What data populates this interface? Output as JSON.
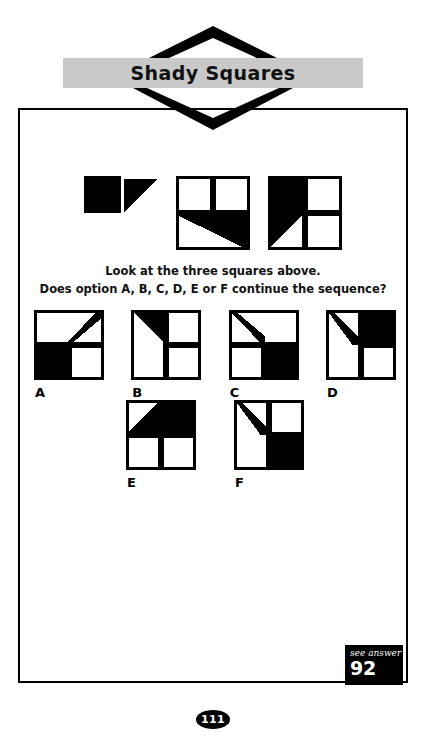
{
  "header": {
    "title": "Shady Squares",
    "banner_color": "#c9c9c9",
    "chevron_up_icon": "chevron-up-icon",
    "chevron_down_icon": "chevron-down-icon"
  },
  "prompt": {
    "line1": "Look at the three squares above.",
    "line2": "Does option A, B, C, D, E or F continue the sequence?"
  },
  "puzzle": {
    "ink_color": "#000000",
    "paper_color": "#ffffff",
    "sequence": [
      {
        "name": "sequence-square-1",
        "shapes": [
          {
            "type": "rect",
            "x": 0,
            "y": 0,
            "w": 50,
            "h": 50,
            "fill": "#000000"
          },
          {
            "type": "rect",
            "x": 4,
            "y": 54,
            "w": 46,
            "h": 46,
            "fill": "#ffffff"
          },
          {
            "type": "poly",
            "points": "54,4 100,4 100,96 54,96 54,50",
            "fill": "#ffffff"
          },
          {
            "type": "poly",
            "points": "54,4 100,4 54,50",
            "fill": "#000000"
          }
        ]
      },
      {
        "name": "sequence-square-2",
        "shapes": [
          {
            "type": "rect",
            "x": 0,
            "y": 0,
            "w": 100,
            "h": 100,
            "fill": "#000000"
          },
          {
            "type": "rect",
            "x": 4,
            "y": 4,
            "w": 42,
            "h": 42,
            "fill": "#ffffff"
          },
          {
            "type": "rect",
            "x": 54,
            "y": 4,
            "w": 42,
            "h": 42,
            "fill": "#ffffff"
          },
          {
            "type": "poly",
            "points": "4,54 96,54 96,96 4,96",
            "fill": "#000000"
          },
          {
            "type": "poly",
            "points": "4,54 4,96 90,96",
            "fill": "#ffffff"
          }
        ]
      },
      {
        "name": "sequence-square-3",
        "shapes": [
          {
            "type": "rect",
            "x": 0,
            "y": 0,
            "w": 100,
            "h": 100,
            "fill": "#000000"
          },
          {
            "type": "poly",
            "points": "4,4 46,4 46,96 4,96",
            "fill": "#000000"
          },
          {
            "type": "poly",
            "points": "4,96 46,54 46,96",
            "fill": "#ffffff"
          },
          {
            "type": "rect",
            "x": 54,
            "y": 4,
            "w": 42,
            "h": 42,
            "fill": "#ffffff"
          },
          {
            "type": "rect",
            "x": 54,
            "y": 54,
            "w": 42,
            "h": 42,
            "fill": "#ffffff"
          }
        ]
      }
    ],
    "options": [
      {
        "label": "A",
        "name": "option-a",
        "shapes": [
          {
            "type": "rect",
            "x": 0,
            "y": 0,
            "w": 100,
            "h": 100,
            "fill": "#000000"
          },
          {
            "type": "rect",
            "x": 4,
            "y": 4,
            "w": 92,
            "h": 42,
            "fill": "#ffffff"
          },
          {
            "type": "poly",
            "points": "88,4 96,4 96,12 56,46 48,46",
            "fill": "#000000"
          },
          {
            "type": "rect",
            "x": 4,
            "y": 54,
            "w": 42,
            "h": 42,
            "fill": "#000000"
          },
          {
            "type": "rect",
            "x": 54,
            "y": 54,
            "w": 42,
            "h": 42,
            "fill": "#ffffff"
          }
        ]
      },
      {
        "label": "B",
        "name": "option-b",
        "shapes": [
          {
            "type": "rect",
            "x": 0,
            "y": 0,
            "w": 100,
            "h": 100,
            "fill": "#000000"
          },
          {
            "type": "rect",
            "x": 4,
            "y": 4,
            "w": 42,
            "h": 92,
            "fill": "#ffffff"
          },
          {
            "type": "poly",
            "points": "4,4 46,4 46,46",
            "fill": "#000000"
          },
          {
            "type": "rect",
            "x": 54,
            "y": 4,
            "w": 42,
            "h": 42,
            "fill": "#ffffff"
          },
          {
            "type": "rect",
            "x": 54,
            "y": 54,
            "w": 42,
            "h": 42,
            "fill": "#ffffff"
          }
        ]
      },
      {
        "label": "C",
        "name": "option-c",
        "shapes": [
          {
            "type": "rect",
            "x": 0,
            "y": 0,
            "w": 100,
            "h": 100,
            "fill": "#000000"
          },
          {
            "type": "rect",
            "x": 4,
            "y": 4,
            "w": 92,
            "h": 42,
            "fill": "#ffffff"
          },
          {
            "type": "poly",
            "points": "4,4 12,4 52,38 52,46 44,46",
            "fill": "#000000"
          },
          {
            "type": "rect",
            "x": 4,
            "y": 54,
            "w": 42,
            "h": 42,
            "fill": "#ffffff"
          },
          {
            "type": "rect",
            "x": 54,
            "y": 54,
            "w": 42,
            "h": 42,
            "fill": "#000000"
          }
        ]
      },
      {
        "label": "D",
        "name": "option-d",
        "shapes": [
          {
            "type": "rect",
            "x": 0,
            "y": 0,
            "w": 100,
            "h": 100,
            "fill": "#000000"
          },
          {
            "type": "rect",
            "x": 4,
            "y": 4,
            "w": 42,
            "h": 92,
            "fill": "#ffffff"
          },
          {
            "type": "poly",
            "points": "4,4 12,4 46,38 46,50 38,50",
            "fill": "#000000"
          },
          {
            "type": "rect",
            "x": 54,
            "y": 4,
            "w": 42,
            "h": 42,
            "fill": "#000000"
          },
          {
            "type": "rect",
            "x": 54,
            "y": 54,
            "w": 42,
            "h": 42,
            "fill": "#ffffff"
          }
        ]
      },
      {
        "label": "E",
        "name": "option-e",
        "shapes": [
          {
            "type": "rect",
            "x": 0,
            "y": 0,
            "w": 100,
            "h": 100,
            "fill": "#000000"
          },
          {
            "type": "rect",
            "x": 4,
            "y": 4,
            "w": 92,
            "h": 42,
            "fill": "#000000"
          },
          {
            "type": "poly",
            "points": "4,4 46,4 4,46",
            "fill": "#ffffff"
          },
          {
            "type": "rect",
            "x": 4,
            "y": 54,
            "w": 42,
            "h": 42,
            "fill": "#ffffff"
          },
          {
            "type": "rect",
            "x": 54,
            "y": 54,
            "w": 42,
            "h": 42,
            "fill": "#ffffff"
          }
        ]
      },
      {
        "label": "F",
        "name": "option-f",
        "shapes": [
          {
            "type": "rect",
            "x": 0,
            "y": 0,
            "w": 100,
            "h": 100,
            "fill": "#000000"
          },
          {
            "type": "rect",
            "x": 4,
            "y": 4,
            "w": 42,
            "h": 92,
            "fill": "#ffffff"
          },
          {
            "type": "poly",
            "points": "4,4 12,4 46,38 46,50 38,50",
            "fill": "#000000"
          },
          {
            "type": "rect",
            "x": 54,
            "y": 4,
            "w": 42,
            "h": 42,
            "fill": "#ffffff"
          },
          {
            "type": "rect",
            "x": 54,
            "y": 54,
            "w": 42,
            "h": 42,
            "fill": "#000000"
          }
        ]
      }
    ]
  },
  "see_answer": {
    "label": "see answer",
    "number": "92"
  },
  "footer": {
    "page_number": "111"
  }
}
